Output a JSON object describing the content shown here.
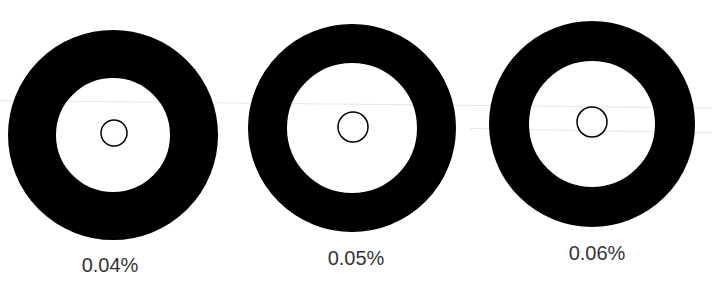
{
  "figure": {
    "ring_color": "#000000",
    "label_color": "#333333",
    "items": [
      {
        "label": "0.04%",
        "center": [
          113,
          135
        ],
        "outer_radius": 105,
        "inner_radius": 57,
        "dot_radius": 13,
        "dot_center": [
          114,
          133
        ],
        "label_pos": [
          110,
          257
        ]
      },
      {
        "label": "0.05%",
        "center": [
          352,
          128
        ],
        "outer_radius": 104,
        "inner_radius": 65,
        "dot_radius": 15,
        "dot_center": [
          353,
          127
        ],
        "label_pos": [
          356,
          250
        ]
      },
      {
        "label": "0.06%",
        "center": [
          592,
          124
        ],
        "outer_radius": 103,
        "inner_radius": 63,
        "dot_radius": 15,
        "dot_center": [
          592,
          122
        ],
        "label_pos": [
          597,
          245
        ]
      }
    ]
  }
}
